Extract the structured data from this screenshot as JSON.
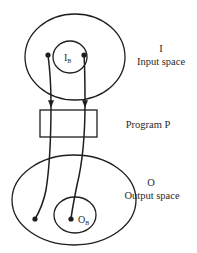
{
  "diagram": {
    "type": "mapping-diagram",
    "input": {
      "symbol": "I",
      "label": "Input space",
      "subset_symbol": "I",
      "subset_subscript": "B"
    },
    "program": {
      "label": "Program P"
    },
    "output": {
      "symbol": "O",
      "label": "Output space",
      "subset_symbol": "O",
      "subset_subscript": "B"
    },
    "colors": {
      "stroke": "#1e1e1e",
      "text": "#2a2a2a",
      "background": "#ffffff"
    }
  }
}
